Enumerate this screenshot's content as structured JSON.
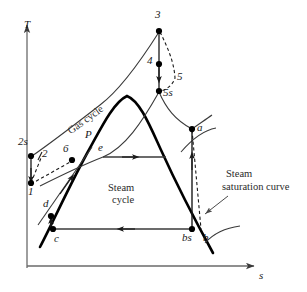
{
  "figure": {
    "kind": "temperature-entropy-diagram",
    "title_visible": false,
    "background_color": "#ffffff",
    "line_color": "#1a1a1a",
    "dome_color": "#000000"
  },
  "axes": {
    "y_label": "T",
    "x_label": "s",
    "y_axis": {
      "x": 27,
      "y_top": 22,
      "y_bottom": 268
    },
    "x_axis": {
      "y": 266,
      "x_left": 27,
      "x_right": 258
    },
    "gridlines": false,
    "ticks": false
  },
  "annotations": {
    "gas_cycle": "Gas cycle",
    "steam_cycle_line1": "Steam",
    "steam_cycle_line2": "cycle",
    "saturation_line1": "Steam",
    "saturation_line2": "saturation curve"
  },
  "state_points": [
    {
      "id": "1",
      "label": "1",
      "x": 31,
      "y": 183,
      "dot": true,
      "label_x": 28,
      "label_y": 192
    },
    {
      "id": "2",
      "label": "2",
      "x": 40,
      "y": 157,
      "dot": false,
      "label_x": 42,
      "label_y": 150
    },
    {
      "id": "2s",
      "label": "2s",
      "x": 31,
      "y": 156,
      "dot": true,
      "label_x": 20,
      "label_y": 140
    },
    {
      "id": "3",
      "label": "3",
      "x": 159,
      "y": 31,
      "dot": true,
      "label_x": 156,
      "label_y": 13
    },
    {
      "id": "4",
      "label": "4",
      "x": 159,
      "y": 64,
      "dot": true,
      "label_x": 148,
      "label_y": 57
    },
    {
      "id": "5",
      "label": "5",
      "x": 175,
      "y": 80,
      "dot": false,
      "label_x": 177,
      "label_y": 73
    },
    {
      "id": "5s",
      "label": "5s",
      "x": 159,
      "y": 91,
      "dot": true,
      "label_x": 163,
      "label_y": 91
    },
    {
      "id": "6",
      "label": "6",
      "x": 72,
      "y": 160,
      "dot": true,
      "label_x": 64,
      "label_y": 146
    },
    {
      "id": "P",
      "label": "P",
      "x": 92,
      "y": 147,
      "dot": false,
      "label_x": 86,
      "label_y": 132
    },
    {
      "id": "e",
      "label": "e",
      "x": 103,
      "y": 157,
      "dot": false,
      "label_x": 99,
      "label_y": 144
    },
    {
      "id": "a",
      "label": "a",
      "x": 192,
      "y": 129,
      "dot": true,
      "label_x": 197,
      "label_y": 125
    },
    {
      "id": "b",
      "label": "b",
      "x": 201,
      "y": 229,
      "dot": false,
      "label_x": 203,
      "label_y": 233
    },
    {
      "id": "bs",
      "label": "bs",
      "x": 192,
      "y": 229,
      "dot": true,
      "label_x": 183,
      "label_y": 233
    },
    {
      "id": "c",
      "label": "c",
      "x": 53,
      "y": 229,
      "dot": true,
      "label_x": 54,
      "label_y": 233
    },
    {
      "id": "d",
      "label": "d",
      "x": 51,
      "y": 216,
      "dot": true,
      "label_x": 43,
      "label_y": 200
    }
  ],
  "processes": [
    {
      "from": "1",
      "to": "2s",
      "style": "solid",
      "name": "compression-ideal"
    },
    {
      "from": "1",
      "to": "2",
      "style": "dashed",
      "name": "compression-actual"
    },
    {
      "from": "2s",
      "to": "3",
      "style": "solid",
      "name": "gas-upper-curve"
    },
    {
      "from": "2",
      "to": "6",
      "style": "dashed",
      "name": "regeneration"
    },
    {
      "from": "6",
      "to": "3",
      "style": "solid",
      "name": "gas-lower-curve"
    },
    {
      "from": "3",
      "to": "5s",
      "style": "solid",
      "name": "expansion-ideal"
    },
    {
      "from": "3",
      "to": "5",
      "style": "dashed",
      "name": "expansion-actual"
    },
    {
      "from": "5s",
      "to": "1",
      "style": "solid",
      "name": "gas-heat-rejection"
    },
    {
      "from": "c",
      "to": "d",
      "style": "solid",
      "name": "pump-ideal"
    },
    {
      "from": "d",
      "to": "e",
      "style": "solid",
      "name": "steam-heating"
    },
    {
      "from": "e",
      "to": "a",
      "style": "solid",
      "name": "boiler-superheat"
    },
    {
      "from": "a",
      "to": "bs",
      "style": "solid",
      "name": "turbine-ideal"
    },
    {
      "from": "a",
      "to": "b",
      "style": "dashed",
      "name": "turbine-actual"
    },
    {
      "from": "bs",
      "to": "c",
      "style": "solid",
      "name": "condenser"
    }
  ],
  "saturation_dome": {
    "peak_x": 126,
    "peak_y": 96,
    "left_foot_x": 44,
    "left_foot_y": 243,
    "right_foot_x": 214,
    "right_foot_y": 252
  }
}
